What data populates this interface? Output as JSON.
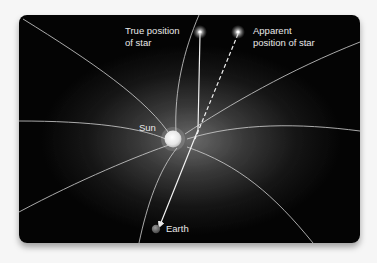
{
  "figure": {
    "labels": {
      "true_star": "True position\nof star",
      "apparent_star": "Apparent\nposition of star",
      "sun": "Sun",
      "earth": "Earth"
    },
    "elements": {
      "true_star_position": {
        "x": 200,
        "y": 32
      },
      "apparent_star_position": {
        "x": 238,
        "y": 32
      },
      "sun_position": {
        "x": 172,
        "y": 138
      },
      "earth_position": {
        "x": 156,
        "y": 229
      }
    },
    "colors": {
      "background": "#050505",
      "glow": "#6a6a6a",
      "field_lines": "#d8d8d8",
      "sun": "#f0f0f0",
      "earth": "#7a7a7a",
      "text": "#e8e8e8"
    }
  }
}
